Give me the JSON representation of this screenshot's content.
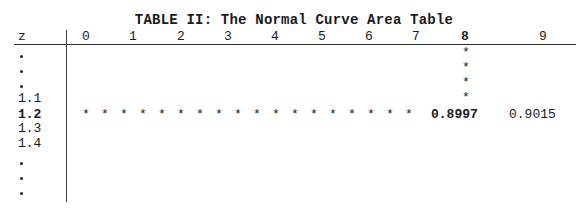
{
  "table": {
    "title": "TABLE II: The Normal Curve Area Table",
    "z_header": "z",
    "column_headers": [
      "0",
      "1",
      "2",
      "3",
      "4",
      "5",
      "6",
      "7",
      "8",
      "9"
    ],
    "highlight_column": "8",
    "z_rows": [
      ".",
      ".",
      ".",
      "1.1",
      "1.2",
      "1.3",
      "1.4",
      ".",
      ".",
      "."
    ],
    "highlight_row": "1.2",
    "row_marker": "*",
    "column_marker": "*",
    "row_marker_count": 18,
    "column_marker_count": 4,
    "cells": {
      "z_1.2_col_8": "0.8997",
      "z_1.2_col_9": "0.9015"
    }
  }
}
